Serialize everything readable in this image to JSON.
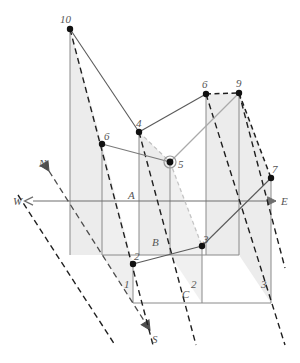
{
  "figure": {
    "type": "technical-line-diagram",
    "background": "#ffffff"
  },
  "colors": {
    "panel_fill": "#ececec",
    "panel_fill_light": "#f2f2f2",
    "line_gray": "#808080",
    "line_dark": "#1a1a1a",
    "line_light_gray": "#b5b5b5",
    "node_fill": "#111111",
    "label_text": "#555555",
    "axis": "#6e6e6e"
  },
  "compass": {
    "west": "W",
    "east": "E",
    "north": "N",
    "south": "S"
  },
  "level_labels": [
    {
      "id": "A",
      "text": "A",
      "x": 128,
      "y": 198
    },
    {
      "id": "B",
      "text": "B",
      "x": 152,
      "y": 245
    },
    {
      "id": "C",
      "text": "C",
      "x": 183,
      "y": 297
    }
  ],
  "nodes": [
    {
      "id": "n10",
      "label": "10",
      "x": 70,
      "y": 29,
      "lx": 64,
      "ly": 21,
      "marker": "dot"
    },
    {
      "id": "n6-left",
      "label": "6",
      "x": 102,
      "y": 144,
      "lx": 104,
      "ly": 138,
      "marker": "dot"
    },
    {
      "id": "n4",
      "label": "4",
      "x": 139,
      "y": 132,
      "lx": 136,
      "ly": 125,
      "marker": "dot"
    },
    {
      "id": "n5",
      "label": "5",
      "x": 170,
      "y": 162,
      "lx": 178,
      "ly": 167,
      "marker": "ring-dot"
    },
    {
      "id": "n6-right",
      "label": "6",
      "x": 206,
      "y": 94,
      "lx": 203,
      "ly": 87,
      "marker": "dot"
    },
    {
      "id": "n9",
      "label": "9",
      "x": 239,
      "y": 93,
      "lx": 237,
      "ly": 86,
      "marker": "dot"
    },
    {
      "id": "n7",
      "label": "7",
      "x": 271,
      "y": 178,
      "lx": 272,
      "ly": 172,
      "marker": "dot"
    },
    {
      "id": "n3-mid",
      "label": "3",
      "x": 202,
      "y": 246,
      "lx": 203,
      "ly": 241,
      "marker": "dot"
    },
    {
      "id": "n2-mid",
      "label": "2",
      "x": 133,
      "y": 264,
      "lx": 135,
      "ly": 259,
      "marker": "dot"
    }
  ],
  "tick_labels": [
    {
      "id": "t1",
      "text": "1",
      "x": 124,
      "y": 287
    },
    {
      "id": "t2",
      "text": "2",
      "x": 192,
      "y": 287
    },
    {
      "id": "t3",
      "text": "3",
      "x": 262,
      "y": 287
    }
  ],
  "geometry": {
    "axis_we_y": 201,
    "axis_we_x1": 33,
    "axis_we_x2": 276,
    "axis_ns_x1": 49,
    "axis_ns_y1": 171,
    "axis_ns_x2": 150,
    "axis_ns_y2": 330,
    "level_line_b_y": 255,
    "level_line_c_y": 303,
    "vertical_x": [
      70,
      102,
      133,
      139,
      170,
      202,
      206,
      239,
      271
    ]
  },
  "edges": [
    {
      "from": "n10",
      "to": "n4",
      "style": "solid-gray"
    },
    {
      "from": "n4",
      "to": "n6-right",
      "style": "solid-gray"
    },
    {
      "from": "n6-right",
      "to": "n9",
      "style": "dashed-dark"
    },
    {
      "from": "n6-left",
      "to": "n5",
      "style": "solid-gray"
    },
    {
      "from": "n4",
      "to": "n5",
      "style": "dashed-light"
    },
    {
      "from": "n5",
      "to": "n9",
      "style": "solid-light"
    },
    {
      "from": "n5",
      "to": "n3-mid",
      "style": "dashed-light"
    },
    {
      "from": "n2-mid",
      "to": "n3-mid",
      "style": "solid-gray"
    },
    {
      "from": "n3-mid",
      "to": "n7",
      "style": "solid-gray"
    },
    {
      "from": "n10",
      "to": "n2-mid",
      "style": "dashed-dark"
    },
    {
      "from": "n9",
      "to": "n7",
      "style": "dashed-dark"
    }
  ]
}
